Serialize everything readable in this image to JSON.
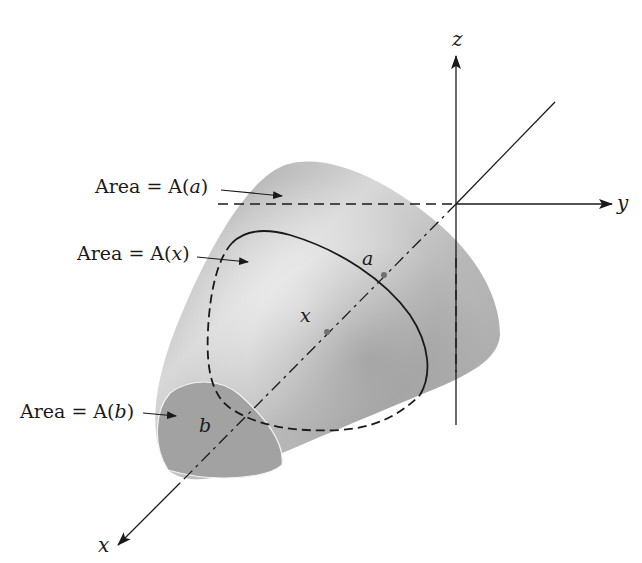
{
  "figure": {
    "axes": {
      "x_label": "x",
      "y_label": "y",
      "z_label": "z"
    },
    "points": {
      "a_label": "a",
      "x_label": "x",
      "b_label": "b"
    },
    "annotations": [
      {
        "prefix": "Area = A(",
        "var": "a",
        "suffix": ")"
      },
      {
        "prefix": "Area = A(",
        "var": "x",
        "suffix": ")"
      },
      {
        "prefix": "Area = A(",
        "var": "b",
        "suffix": ")"
      }
    ],
    "colors": {
      "solid_light": "#e6e6e6",
      "solid_mid": "#b4b4b4",
      "solid_dark": "#8e8e8e",
      "face": "#a0a0a0",
      "line": "#1a1a1a"
    }
  }
}
